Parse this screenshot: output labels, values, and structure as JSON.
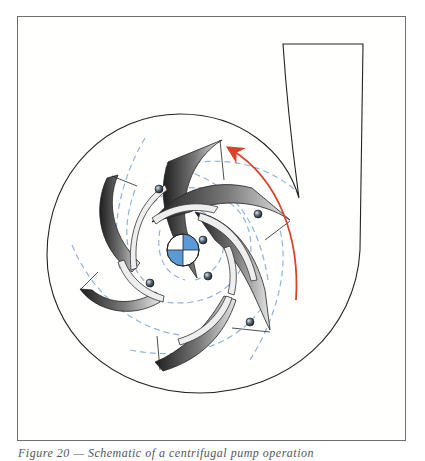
{
  "figure": {
    "caption": "Figure 20 — Schematic of a centrifugal pump operation",
    "type": "centrifugal pump schematic",
    "components": {
      "casing": "volute casing with discharge outlet",
      "impeller": {
        "blade_count": 6,
        "shading": "gradient grey/black"
      },
      "hub": {
        "quadrant_color": "#5b9bd5"
      },
      "flow_lines": {
        "style": "dashed",
        "color": "#8fb4dc"
      },
      "particles": {
        "count": 6
      },
      "rotation_arrow": {
        "color": "#d9432a",
        "direction": "counter-clockwise"
      }
    }
  }
}
